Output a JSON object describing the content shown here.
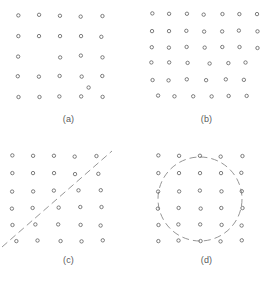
{
  "figure": {
    "background_color": "#ffffff",
    "marker_color": "#6e6e6e",
    "boundary_color": "#8a8a8a",
    "marker_shape": "open-circle",
    "marker_radius": 1.7
  },
  "panels": [
    {
      "id": "a",
      "caption": "(a)",
      "boundary": null,
      "origin": {
        "x": 18,
        "y": 14
      },
      "spacing": {
        "x": 21,
        "y": 20
      },
      "grid": {
        "cols": 5,
        "rows": 5
      }
    },
    {
      "id": "b",
      "caption": "(b)",
      "boundary": null,
      "origin": {
        "x": 14,
        "y": 12
      },
      "spacing": {
        "x": 17.5,
        "y": 16.5
      },
      "grid": {
        "cols": 7,
        "rows": 6
      }
    },
    {
      "id": "c",
      "caption": "(c)",
      "boundary": "dashed-diagonal-line",
      "origin": {
        "x": 12,
        "y": 13
      },
      "spacing": {
        "x": 21,
        "y": 17
      },
      "grid": {
        "cols": 5,
        "rows": 6
      }
    },
    {
      "id": "d",
      "caption": "(d)",
      "boundary": "dashed-circle",
      "origin": {
        "x": 20,
        "y": 13
      },
      "spacing": {
        "x": 21,
        "y": 17
      },
      "grid": {
        "cols": 5,
        "rows": 6
      }
    }
  ],
  "chart_data": {
    "type": "scatter",
    "title": "",
    "subtitle": "",
    "xlabel": "",
    "ylabel": "",
    "grid": false,
    "legend": null,
    "panel_layout": {
      "rows": 2,
      "cols": 2
    },
    "panels": [
      {
        "id": "a",
        "caption": "(a)",
        "description": "jittered 5 by 5 grid of open circles with one missing site and one extra offset point",
        "xlim": [
          0,
          120
        ],
        "ylim": [
          0,
          110
        ],
        "points": [
          {
            "x": 18,
            "y": 14
          },
          {
            "x": 39,
            "y": 13
          },
          {
            "x": 60,
            "y": 14
          },
          {
            "x": 81,
            "y": 14
          },
          {
            "x": 102,
            "y": 14
          },
          {
            "x": 18,
            "y": 34
          },
          {
            "x": 39,
            "y": 34
          },
          {
            "x": 60,
            "y": 34
          },
          {
            "x": 81,
            "y": 34
          },
          {
            "x": 102,
            "y": 35
          },
          {
            "x": 18,
            "y": 54
          },
          {
            "x": 60,
            "y": 55
          },
          {
            "x": 81,
            "y": 54
          },
          {
            "x": 102,
            "y": 55
          },
          {
            "x": 18,
            "y": 74
          },
          {
            "x": 39,
            "y": 74
          },
          {
            "x": 60,
            "y": 74
          },
          {
            "x": 81,
            "y": 74
          },
          {
            "x": 102,
            "y": 74
          },
          {
            "x": 18,
            "y": 95
          },
          {
            "x": 39,
            "y": 95
          },
          {
            "x": 60,
            "y": 95
          },
          {
            "x": 81,
            "y": 95
          },
          {
            "x": 102,
            "y": 95
          },
          {
            "x": 89,
            "y": 85
          }
        ]
      },
      {
        "id": "b",
        "caption": "(b)",
        "description": "denser jittered 7 by 6 grid of open circles with two missing sites",
        "xlim": [
          0,
          120
        ],
        "ylim": [
          0,
          110
        ],
        "points": [
          {
            "x": 14,
            "y": 12
          },
          {
            "x": 31,
            "y": 12
          },
          {
            "x": 49,
            "y": 12
          },
          {
            "x": 66,
            "y": 12
          },
          {
            "x": 84,
            "y": 12
          },
          {
            "x": 101,
            "y": 12
          },
          {
            "x": 119,
            "y": 12
          },
          {
            "x": 14,
            "y": 29
          },
          {
            "x": 31,
            "y": 29
          },
          {
            "x": 49,
            "y": 29
          },
          {
            "x": 66,
            "y": 29
          },
          {
            "x": 84,
            "y": 29
          },
          {
            "x": 101,
            "y": 29
          },
          {
            "x": 119,
            "y": 29
          },
          {
            "x": 14,
            "y": 45
          },
          {
            "x": 31,
            "y": 45
          },
          {
            "x": 49,
            "y": 45
          },
          {
            "x": 66,
            "y": 45
          },
          {
            "x": 84,
            "y": 45
          },
          {
            "x": 101,
            "y": 45
          },
          {
            "x": 119,
            "y": 46
          },
          {
            "x": 14,
            "y": 61
          },
          {
            "x": 31,
            "y": 61
          },
          {
            "x": 49,
            "y": 61
          },
          {
            "x": 72,
            "y": 61
          },
          {
            "x": 90,
            "y": 61
          },
          {
            "x": 108,
            "y": 61
          },
          {
            "x": 14,
            "y": 78
          },
          {
            "x": 31,
            "y": 78
          },
          {
            "x": 49,
            "y": 78
          },
          {
            "x": 68,
            "y": 78
          },
          {
            "x": 88,
            "y": 78
          },
          {
            "x": 106,
            "y": 78
          },
          {
            "x": 20,
            "y": 94
          },
          {
            "x": 37,
            "y": 94
          },
          {
            "x": 55,
            "y": 94
          },
          {
            "x": 73,
            "y": 94
          },
          {
            "x": 91,
            "y": 94
          },
          {
            "x": 109,
            "y": 94
          }
        ]
      },
      {
        "id": "c",
        "caption": "(c)",
        "description": "5 by 6 grid of open circles cut by a dashed diagonal line running from lower left to upper right",
        "xlim": [
          0,
          120
        ],
        "ylim": [
          0,
          110
        ],
        "points": [
          {
            "x": 12,
            "y": 13
          },
          {
            "x": 33,
            "y": 13
          },
          {
            "x": 54,
            "y": 13
          },
          {
            "x": 75,
            "y": 13
          },
          {
            "x": 96,
            "y": 13
          },
          {
            "x": 12,
            "y": 30
          },
          {
            "x": 33,
            "y": 30
          },
          {
            "x": 54,
            "y": 30
          },
          {
            "x": 75,
            "y": 31
          },
          {
            "x": 99,
            "y": 31
          },
          {
            "x": 12,
            "y": 48
          },
          {
            "x": 33,
            "y": 48
          },
          {
            "x": 54,
            "y": 48
          },
          {
            "x": 78,
            "y": 47
          },
          {
            "x": 101,
            "y": 47
          },
          {
            "x": 12,
            "y": 65
          },
          {
            "x": 33,
            "y": 65
          },
          {
            "x": 58,
            "y": 64
          },
          {
            "x": 80,
            "y": 64
          },
          {
            "x": 101,
            "y": 64
          },
          {
            "x": 12,
            "y": 82
          },
          {
            "x": 36,
            "y": 82
          },
          {
            "x": 58,
            "y": 82
          },
          {
            "x": 80,
            "y": 82
          },
          {
            "x": 101,
            "y": 82
          },
          {
            "x": 16,
            "y": 98
          },
          {
            "x": 38,
            "y": 98
          },
          {
            "x": 60,
            "y": 98
          },
          {
            "x": 82,
            "y": 98
          },
          {
            "x": 103,
            "y": 98
          }
        ],
        "boundary": {
          "type": "dashed-diagonal-line",
          "x1": 2,
          "y1": 104,
          "x2": 112,
          "y2": 8
        }
      },
      {
        "id": "d",
        "caption": "(d)",
        "description": "5 by 6 grid of open circles with a dashed circle enclosing the central region",
        "xlim": [
          0,
          120
        ],
        "ylim": [
          0,
          110
        ],
        "points": [
          {
            "x": 20,
            "y": 13
          },
          {
            "x": 41,
            "y": 13
          },
          {
            "x": 62,
            "y": 13
          },
          {
            "x": 83,
            "y": 13
          },
          {
            "x": 104,
            "y": 13
          },
          {
            "x": 20,
            "y": 30
          },
          {
            "x": 41,
            "y": 30
          },
          {
            "x": 62,
            "y": 30
          },
          {
            "x": 83,
            "y": 30
          },
          {
            "x": 104,
            "y": 30
          },
          {
            "x": 20,
            "y": 48
          },
          {
            "x": 41,
            "y": 48
          },
          {
            "x": 62,
            "y": 48
          },
          {
            "x": 83,
            "y": 48
          },
          {
            "x": 104,
            "y": 48
          },
          {
            "x": 20,
            "y": 65
          },
          {
            "x": 41,
            "y": 65
          },
          {
            "x": 62,
            "y": 65
          },
          {
            "x": 83,
            "y": 65
          },
          {
            "x": 104,
            "y": 65
          },
          {
            "x": 20,
            "y": 82
          },
          {
            "x": 41,
            "y": 82
          },
          {
            "x": 62,
            "y": 82
          },
          {
            "x": 83,
            "y": 82
          },
          {
            "x": 104,
            "y": 82
          },
          {
            "x": 20,
            "y": 98
          },
          {
            "x": 41,
            "y": 98
          },
          {
            "x": 62,
            "y": 98
          },
          {
            "x": 83,
            "y": 98
          },
          {
            "x": 104,
            "y": 98
          }
        ],
        "boundary": {
          "type": "dashed-circle",
          "cx": 62,
          "cy": 56,
          "r": 42
        }
      }
    ]
  }
}
